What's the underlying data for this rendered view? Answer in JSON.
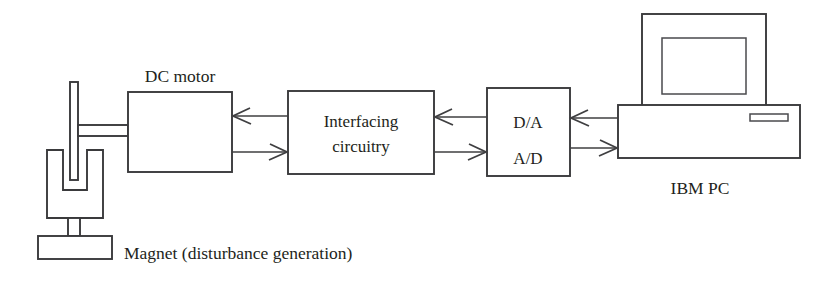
{
  "diagram": {
    "line_color": "#3a3a3c",
    "text_color": "#231f20",
    "background": "#ffffff",
    "blocks": [
      {
        "id": "dc-motor",
        "label": "DC motor",
        "label_position": "above",
        "x": 128,
        "y": 92,
        "w": 104,
        "h": 80
      },
      {
        "id": "interfacing-circuitry",
        "label_line1": "Interfacing",
        "label_line2": "circuitry",
        "label_position": "inside",
        "x": 288,
        "y": 91,
        "w": 146,
        "h": 83
      },
      {
        "id": "converter",
        "label_line1": "D/A",
        "label_line2": "A/D",
        "label_position": "inside",
        "x": 487,
        "y": 88,
        "w": 83,
        "h": 88
      }
    ],
    "computer": {
      "label": "IBM PC",
      "monitor": {
        "x": 642,
        "y": 14,
        "w": 124,
        "h": 92
      },
      "screen": {
        "x": 662,
        "y": 38,
        "w": 84,
        "h": 56
      },
      "case": {
        "x": 618,
        "y": 105,
        "w": 182,
        "h": 53
      },
      "floppy_slot": {
        "x": 750,
        "y": 114,
        "w": 38,
        "h": 7
      }
    },
    "magnet_assembly": {
      "caption": "Magnet (disturbance generation)",
      "rod": {
        "x": 70,
        "y": 82,
        "w": 8,
        "h": 98
      },
      "shaft_top_y": 125,
      "shaft_bottom_y": 136,
      "shaft_x1": 78,
      "shaft_x2": 128,
      "u_magnet": {
        "x": 47,
        "y": 150,
        "w": 56,
        "h": 68,
        "gap_w": 16,
        "gap_h": 40
      },
      "stem": {
        "x": 68,
        "y": 218,
        "w": 12,
        "h": 18
      },
      "base": {
        "x": 38,
        "y": 236,
        "w": 74,
        "h": 23
      }
    },
    "arrows": [
      {
        "id": "interfacing-to-motor",
        "from": "interfacing-circuitry",
        "to": "dc-motor",
        "direction": "left",
        "x1": 288,
        "x2": 232,
        "y": 116
      },
      {
        "id": "motor-to-interfacing",
        "from": "dc-motor",
        "to": "interfacing-circuitry",
        "direction": "right",
        "x1": 232,
        "x2": 288,
        "y": 152
      },
      {
        "id": "converter-to-interfacing",
        "from": "converter",
        "to": "interfacing-circuitry",
        "direction": "left",
        "x1": 487,
        "x2": 434,
        "y": 117
      },
      {
        "id": "interfacing-to-converter",
        "from": "interfacing-circuitry",
        "to": "converter",
        "direction": "right",
        "x1": 434,
        "x2": 487,
        "y": 152
      },
      {
        "id": "pc-to-converter",
        "from": "computer",
        "to": "converter",
        "direction": "left",
        "x1": 618,
        "x2": 570,
        "y": 118
      },
      {
        "id": "converter-to-pc",
        "from": "converter",
        "to": "computer",
        "direction": "right",
        "x1": 570,
        "x2": 618,
        "y": 148
      }
    ],
    "labels": {
      "dc_motor": "DC motor",
      "interfacing_line1": "Interfacing",
      "interfacing_line2": "circuitry",
      "da": "D/A",
      "ad": "A/D",
      "ibm_pc": "IBM PC",
      "magnet_caption": "Magnet (disturbance generation)"
    }
  }
}
